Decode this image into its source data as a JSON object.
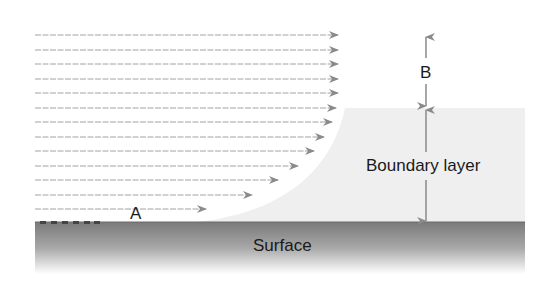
{
  "diagram": {
    "labels": {
      "a": "A",
      "b": "B",
      "boundary_layer": "Boundary layer",
      "surface": "Surface"
    },
    "flow_arrows": {
      "count": 13,
      "start_x": 35,
      "rows_y": [
        35,
        50,
        64,
        79,
        93,
        108,
        122,
        137,
        151,
        166,
        180,
        195,
        209
      ],
      "tip_x": [
        338,
        338,
        338,
        338,
        338,
        336,
        332,
        324,
        314,
        298,
        278,
        252,
        206
      ]
    },
    "colors": {
      "arrow": "#8a8a8a",
      "boundary_layer_fill": "#efefef",
      "surface_top": "#7a7a7a",
      "surface_bottom": "#ffffff",
      "dimension_line": "#8a8a8a",
      "text": "#1a1a1a"
    }
  }
}
